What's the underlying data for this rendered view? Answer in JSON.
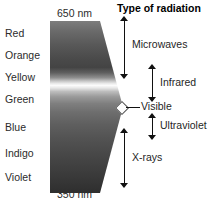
{
  "diagram": {
    "title": "Type of radiation",
    "visible_spectrum_colors": [
      {
        "label": "Red",
        "top": 28
      },
      {
        "label": "Orange",
        "top": 50
      },
      {
        "label": "Yellow",
        "top": 72
      },
      {
        "label": "Green",
        "top": 94
      },
      {
        "label": "Blue",
        "top": 122
      },
      {
        "label": "Indigo",
        "top": 148
      },
      {
        "label": "Violet",
        "top": 172
      }
    ],
    "wavelengths": {
      "top": "650 nm",
      "bottom": "350 nm"
    },
    "radiation_bands": [
      {
        "name": "Microwaves",
        "arrow": "double-headed-vertical"
      },
      {
        "name": "Infrared",
        "arrow": "double-headed-vertical"
      },
      {
        "name": "Visible",
        "arrow": "leader-line"
      },
      {
        "name": "Ultraviolet",
        "arrow": "double-headed-vertical"
      },
      {
        "name": "X-rays",
        "arrow": "double-headed-vertical"
      }
    ],
    "colors": {
      "background": "#ffffff",
      "text": "#1f1f1f",
      "arrow": "#111111",
      "spectrum_dark": "#2e2e2e",
      "spectrum_light": "#fbfbfb"
    }
  }
}
